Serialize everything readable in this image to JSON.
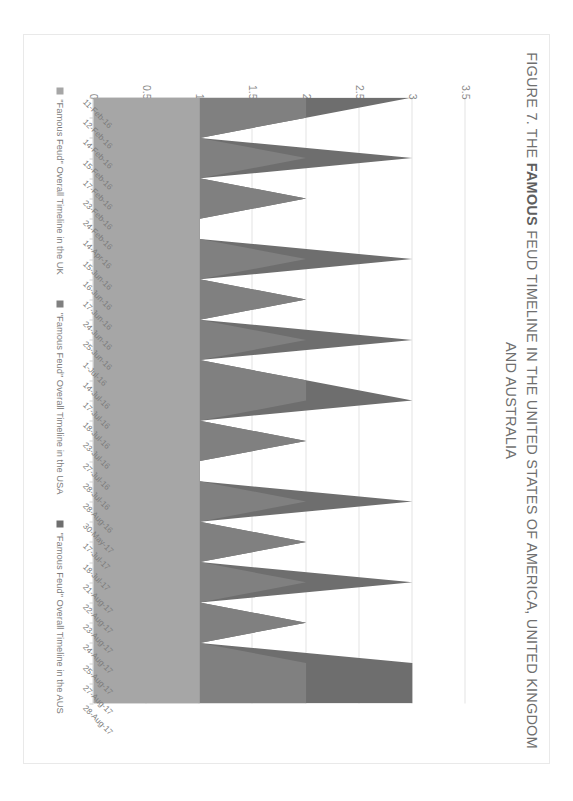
{
  "figure": {
    "title_prefix": "FIGURE 7. THE ",
    "title_bold": "FAMOUS",
    "title_suffix": " FEUD TIMELINE IN THE UNITED STATES OF AMERICA, UNITED KINGDOM AND AUSTRALIA",
    "title_full": "FIGURE 7. THE FAMOUS FEUD TIMELINE IN THE UNITED STATES OF AMERICA, UNITED KINGDOM AND AUSTRALIA"
  },
  "colors": {
    "series_uk": "#a6a6a6",
    "series_usa": "#808080",
    "series_aus": "#6e6e6e",
    "gridline": "#e4e4e4",
    "axis": "#d6d6d6",
    "text": "#7b7b7b",
    "title_text": "#6f6f6f",
    "frame": "#e9e9e9",
    "background": "#ffffff"
  },
  "legend": {
    "position": "bottom",
    "items": [
      {
        "label": "\"Famous Feud\" Overall Timeline in the UK",
        "color": "#a6a6a6"
      },
      {
        "label": "\"Famous Feud\" Overall Timeline in the USA",
        "color": "#808080"
      },
      {
        "label": "\"Famous Feud\" Overall Timeline in the AUS",
        "color": "#6e6e6e"
      }
    ]
  },
  "chart_data": {
    "type": "area",
    "stacked": true,
    "orientation": "rotated-90",
    "title": "FIGURE 7. THE FAMOUS FEUD TIMELINE IN THE UNITED STATES OF AMERICA, UNITED KINGDOM AND AUSTRALIA",
    "xlabel": "",
    "ylabel": "",
    "ylim": [
      0,
      3.5
    ],
    "yticks": [
      "0",
      "0.5",
      "1",
      "1.5",
      "2",
      "2.5",
      "3",
      "3.5"
    ],
    "ytick_values": [
      0,
      0.5,
      1,
      1.5,
      2,
      2.5,
      3,
      3.5
    ],
    "grid": true,
    "categories": [
      "11-Feb-16",
      "12-Feb-16",
      "14-Feb-16",
      "15-Feb-16",
      "17-Feb-16",
      "23-Feb-16",
      "24-Feb-16",
      "14-Apr-16",
      "15-Jun-16",
      "16-Jun-16",
      "17-Jun-16",
      "24-Jun-16",
      "25-Jun-16",
      "1-Jul-16",
      "14-Jul-16",
      "17-Jul-16",
      "18-Jul-16",
      "23-Jul-16",
      "27-Jul-16",
      "28-Jul-16",
      "28-Aug-16",
      "30-May-17",
      "17-Jul-17",
      "18-Jul-17",
      "21-Aug-17",
      "22-Aug-17",
      "23-Aug-17",
      "24-Aug-17",
      "25-Aug-17",
      "27-Aug-17",
      "28-Aug-17"
    ],
    "series": [
      {
        "name": "\"Famous Feud\" Overall Timeline in the UK",
        "color": "#a6a6a6",
        "values": [
          1,
          1,
          1,
          1,
          1,
          1,
          1,
          1,
          1,
          1,
          1,
          1,
          1,
          1,
          1,
          1,
          1,
          1,
          1,
          1,
          1,
          1,
          1,
          1,
          1,
          1,
          1,
          1,
          1,
          1,
          1
        ]
      },
      {
        "name": "\"Famous Feud\" Overall Timeline in the USA",
        "color": "#808080",
        "values": [
          1,
          1,
          0,
          1,
          0,
          1,
          0,
          0,
          1,
          0,
          1,
          0,
          1,
          0,
          1,
          1,
          0,
          1,
          0,
          0,
          1,
          0,
          1,
          0,
          1,
          0,
          1,
          0,
          1,
          1,
          1
        ]
      },
      {
        "name": "\"Famous Feud\" Overall Timeline in the AUS",
        "color": "#6e6e6e",
        "values": [
          1,
          0,
          0,
          1,
          0,
          0,
          0,
          0,
          1,
          0,
          0,
          0,
          1,
          0,
          0,
          1,
          0,
          0,
          0,
          0,
          1,
          0,
          0,
          0,
          1,
          0,
          0,
          0,
          1,
          1,
          1
        ]
      }
    ]
  }
}
